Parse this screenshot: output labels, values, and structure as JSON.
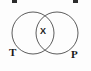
{
  "figure": {
    "type": "venn-diagram",
    "background_color": "#fdfdfd",
    "stroke_color": "#4a4a4a",
    "text_color": "#1a1a1a"
  },
  "labels": {
    "left_circle": "T",
    "right_circle": "P",
    "intersection": "X"
  },
  "top_marks": {
    "left": " ",
    "right": " "
  },
  "chart_data": {
    "type": "venn",
    "title": "",
    "sets": [
      {
        "name": "T",
        "label": "T",
        "cx": 33,
        "cy": 33,
        "r": 21
      },
      {
        "name": "P",
        "label": "P",
        "cx": 57,
        "cy": 33,
        "r": 21
      }
    ],
    "region_labels": [
      {
        "region": "intersection",
        "text": "X",
        "x": 45,
        "y": 32
      }
    ],
    "legend": "none",
    "grid": false
  }
}
